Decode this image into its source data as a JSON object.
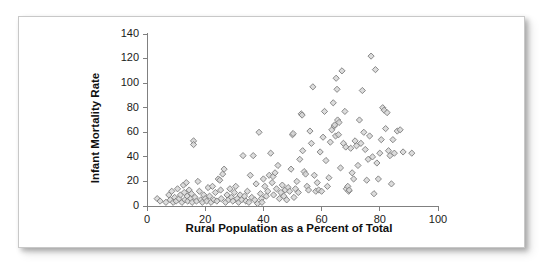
{
  "chart_data": {
    "type": "scatter",
    "title": "",
    "xlabel": "Rural Population as a Percent of Total",
    "ylabel": "Infant Mortality Rate",
    "xlim": [
      0,
      100
    ],
    "ylim": [
      0,
      140
    ],
    "xticks": [
      0,
      20,
      40,
      60,
      80,
      100
    ],
    "yticks": [
      0,
      20,
      40,
      60,
      80,
      100,
      120,
      140
    ],
    "grid": false,
    "legend": null,
    "marker": {
      "shape": "diamond",
      "fill_color": "#d6d6d6",
      "edge_color": "#7d7d7d",
      "size_px": 5
    },
    "axis_color": "#808080",
    "series": [
      {
        "name": "Countries",
        "points": [
          [
            3.5,
            6
          ],
          [
            4.5,
            4
          ],
          [
            6.5,
            3
          ],
          [
            7.5,
            9
          ],
          [
            8,
            5
          ],
          [
            8.5,
            12
          ],
          [
            9,
            3
          ],
          [
            9.5,
            7
          ],
          [
            10,
            4
          ],
          [
            10.5,
            14
          ],
          [
            11,
            6
          ],
          [
            11.5,
            9
          ],
          [
            12,
            3
          ],
          [
            12.5,
            17
          ],
          [
            12.8,
            11
          ],
          [
            13,
            5
          ],
          [
            13.5,
            19
          ],
          [
            13.8,
            8
          ],
          [
            14,
            4
          ],
          [
            14.5,
            13
          ],
          [
            15,
            6
          ],
          [
            15.3,
            10
          ],
          [
            15.5,
            3
          ],
          [
            16,
            53
          ],
          [
            16,
            50
          ],
          [
            16.5,
            7
          ],
          [
            17,
            4
          ],
          [
            17.5,
            20
          ],
          [
            18,
            12
          ],
          [
            18.5,
            5
          ],
          [
            19,
            3
          ],
          [
            19.5,
            9
          ],
          [
            20,
            6
          ],
          [
            20.5,
            4
          ],
          [
            21,
            15
          ],
          [
            21.5,
            8
          ],
          [
            22,
            3
          ],
          [
            22.5,
            16
          ],
          [
            23,
            5
          ],
          [
            23.5,
            11
          ],
          [
            24,
            4
          ],
          [
            24.5,
            22
          ],
          [
            25,
            21
          ],
          [
            25.3,
            13
          ],
          [
            25.5,
            6
          ],
          [
            26,
            26
          ],
          [
            26.5,
            30
          ],
          [
            27,
            3
          ],
          [
            27.5,
            9
          ],
          [
            28,
            5
          ],
          [
            28.5,
            14
          ],
          [
            29,
            7
          ],
          [
            29.5,
            4
          ],
          [
            30,
            11
          ],
          [
            30.5,
            16
          ],
          [
            31,
            6
          ],
          [
            31.5,
            3
          ],
          [
            32,
            9
          ],
          [
            32.5,
            5
          ],
          [
            33,
            41
          ],
          [
            33.5,
            8
          ],
          [
            34,
            4
          ],
          [
            34.5,
            12
          ],
          [
            35,
            3
          ],
          [
            35.5,
            25
          ],
          [
            36,
            7
          ],
          [
            36.5,
            41
          ],
          [
            37,
            5
          ],
          [
            37.5,
            18
          ],
          [
            38,
            2
          ],
          [
            38.5,
            60
          ],
          [
            39,
            10
          ],
          [
            39.3,
            6
          ],
          [
            39.5,
            3
          ],
          [
            40,
            22
          ],
          [
            40.5,
            16
          ],
          [
            41,
            8
          ],
          [
            41.5,
            12
          ],
          [
            42,
            25
          ],
          [
            42.5,
            43
          ],
          [
            43,
            19
          ],
          [
            43.3,
            24
          ],
          [
            43.5,
            9
          ],
          [
            44,
            27
          ],
          [
            44.5,
            14
          ],
          [
            45,
            33
          ],
          [
            45.5,
            6
          ],
          [
            46,
            11
          ],
          [
            46.5,
            17
          ],
          [
            47,
            8
          ],
          [
            47.5,
            13
          ],
          [
            48,
            5
          ],
          [
            48.5,
            15
          ],
          [
            49,
            12
          ],
          [
            49.5,
            30
          ],
          [
            50,
            58
          ],
          [
            50.2,
            59
          ],
          [
            50.5,
            7
          ],
          [
            51,
            14
          ],
          [
            51.5,
            20
          ],
          [
            52,
            11
          ],
          [
            52.5,
            38
          ],
          [
            53,
            75
          ],
          [
            53.3,
            74
          ],
          [
            53.5,
            45
          ],
          [
            54,
            28
          ],
          [
            54.5,
            26
          ],
          [
            55,
            16
          ],
          [
            55.5,
            13
          ],
          [
            56,
            61
          ],
          [
            56.5,
            51
          ],
          [
            57,
            97
          ],
          [
            57.5,
            25
          ],
          [
            58,
            12
          ],
          [
            58.5,
            19
          ],
          [
            59,
            13
          ],
          [
            59.5,
            44
          ],
          [
            60,
            12
          ],
          [
            60.5,
            56
          ],
          [
            61,
            77
          ],
          [
            61.5,
            37
          ],
          [
            62,
            16
          ],
          [
            62.5,
            23
          ],
          [
            63,
            52
          ],
          [
            63.5,
            62
          ],
          [
            64,
            84
          ],
          [
            64.3,
            65
          ],
          [
            64.5,
            66
          ],
          [
            64.8,
            57
          ],
          [
            65,
            104
          ],
          [
            65.3,
            95
          ],
          [
            65.5,
            70
          ],
          [
            65.8,
            58
          ],
          [
            66,
            68
          ],
          [
            66.5,
            31
          ],
          [
            67,
            110
          ],
          [
            67.5,
            51
          ],
          [
            68,
            77
          ],
          [
            68.3,
            48
          ],
          [
            68.5,
            14
          ],
          [
            69,
            16
          ],
          [
            69.3,
            12
          ],
          [
            69.5,
            13
          ],
          [
            70,
            47
          ],
          [
            70.5,
            27
          ],
          [
            71,
            22
          ],
          [
            71.5,
            53
          ],
          [
            72,
            49
          ],
          [
            72.5,
            33
          ],
          [
            73,
            70
          ],
          [
            73.5,
            51
          ],
          [
            74,
            94
          ],
          [
            74.5,
            60
          ],
          [
            75,
            46
          ],
          [
            75.5,
            21
          ],
          [
            76,
            38
          ],
          [
            76.5,
            57
          ],
          [
            77,
            122
          ],
          [
            77.5,
            40
          ],
          [
            78,
            10
          ],
          [
            78.5,
            111
          ],
          [
            79,
            35
          ],
          [
            79.5,
            22
          ],
          [
            80,
            43
          ],
          [
            80.5,
            54
          ],
          [
            81,
            80
          ],
          [
            81.5,
            78
          ],
          [
            82,
            63
          ],
          [
            82.5,
            76
          ],
          [
            83,
            45
          ],
          [
            83.5,
            41
          ],
          [
            84,
            18
          ],
          [
            84.5,
            54
          ],
          [
            85,
            43
          ],
          [
            86,
            61
          ],
          [
            87,
            62
          ],
          [
            88,
            44
          ],
          [
            91,
            43
          ]
        ]
      }
    ]
  },
  "axis_labels": {
    "x_title": "Rural Population as a Percent of Total",
    "y_title": "Infant Mortality Rate",
    "x_tick_labels": [
      "0",
      "20",
      "40",
      "60",
      "80",
      "100"
    ],
    "y_tick_labels": [
      "0",
      "20",
      "40",
      "60",
      "80",
      "100",
      "120",
      "140"
    ]
  }
}
